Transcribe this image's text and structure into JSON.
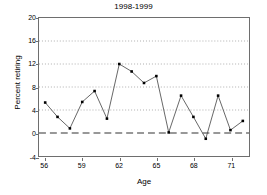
{
  "chart_data": {
    "type": "line",
    "title": "1998-1999",
    "xlabel": "Age",
    "ylabel": "Percent retiring",
    "x": [
      56,
      57,
      58,
      59,
      60,
      61,
      62,
      63,
      64,
      65,
      66,
      67,
      68,
      69,
      70,
      71,
      72
    ],
    "values": [
      5.3,
      2.8,
      0.8,
      5.4,
      7.3,
      2.5,
      12.0,
      10.7,
      8.7,
      9.9,
      0.1,
      6.5,
      2.8,
      -1.0,
      6.5,
      0.5,
      2.1
    ],
    "series": [
      {
        "name": "Percent retiring",
        "values": [
          5.3,
          2.8,
          0.8,
          5.4,
          7.3,
          2.5,
          12.0,
          10.7,
          8.7,
          9.9,
          0.1,
          6.5,
          2.8,
          -1.0,
          6.5,
          0.5,
          2.1
        ]
      }
    ],
    "xlim": [
      55.5,
      72.5
    ],
    "ylim": [
      -4,
      20
    ],
    "xticks": [
      56,
      59,
      62,
      65,
      68,
      71
    ],
    "yticks": [
      -4,
      0,
      4,
      8,
      12,
      16,
      20
    ],
    "ytick_labels": [
      "-4",
      "0",
      "4",
      "8",
      "12",
      "16",
      "20"
    ],
    "xtick_labels": [
      "56",
      "59",
      "62",
      "65",
      "68",
      "71"
    ],
    "grid": "horizontal-dotted",
    "zero_line": "dashed",
    "legend": "none",
    "marker": "filled-square",
    "line_color": "#555555",
    "marker_color": "#000000",
    "grid_color": "#999999",
    "frame_color": "#6e6e6e",
    "background": "#ffffff"
  }
}
